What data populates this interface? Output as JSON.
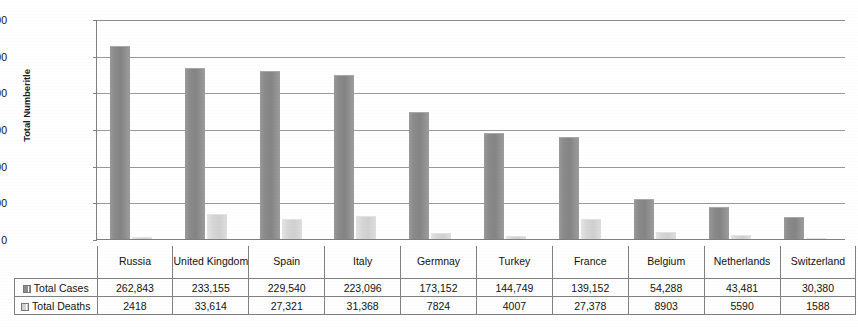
{
  "chart_data": {
    "type": "bar",
    "title": "",
    "xlabel": "",
    "ylabel": "Total Numberitle",
    "ylim": [
      0,
      300000
    ],
    "ytick_step": 50000,
    "grid": true,
    "legend_position": "table-row-headers",
    "categories": [
      "Russia",
      "United Kingdom",
      "Spain",
      "Italy",
      "Germnay",
      "Turkey",
      "France",
      "Belgium",
      "Netherlands",
      "Switzerland"
    ],
    "series": [
      {
        "name": "Total Cases",
        "color": "#8b8b8b",
        "values": [
          262843,
          233155,
          229540,
          223096,
          173152,
          144749,
          139152,
          54288,
          43481,
          30380
        ],
        "labels": [
          "262,843",
          "233,155",
          "229,540",
          "223,096",
          "173,152",
          "144,749",
          "139,152",
          "54,288",
          "43,481",
          "30,380"
        ]
      },
      {
        "name": "Total Deaths",
        "color": "#d6d6d6",
        "values": [
          2418,
          33614,
          27321,
          31368,
          7824,
          4007,
          27378,
          8903,
          5590,
          1588
        ],
        "labels": [
          "2418",
          "33,614",
          "27,321",
          "31,368",
          "7824",
          "4007",
          "27,378",
          "8903",
          "5590",
          "1588"
        ]
      }
    ],
    "ytick_labels": [
      "300,000",
      "250,000",
      "200,000",
      "150,000",
      "100,000",
      "50,000",
      "0"
    ],
    "ytick_values": [
      300000,
      250000,
      200000,
      150000,
      100000,
      50000,
      0
    ]
  },
  "axis": {
    "y_title": "Total Numberitle"
  },
  "table": {
    "category_header": [
      "Russia",
      "United Kingdom",
      "Spain",
      "Italy",
      "Germnay",
      "Turkey",
      "France",
      "Belgium",
      "Netherlands",
      "Switzerland"
    ],
    "rows": [
      {
        "label": "Total Cases",
        "swatch": "cases-swatch",
        "values": [
          "262,843",
          "233,155",
          "229,540",
          "223,096",
          "173,152",
          "144,749",
          "139,152",
          "54,288",
          "43,481",
          "30,380"
        ]
      },
      {
        "label": "Total Deaths",
        "swatch": "deaths-swatch",
        "values": [
          "2418",
          "33,614",
          "27,321",
          "31,368",
          "7824",
          "4007",
          "27,378",
          "8903",
          "5590",
          "1588"
        ]
      }
    ]
  },
  "colors": {
    "cases_bar": "#8b8b8b",
    "deaths_bar": "#d6d6d6",
    "gridline": "#9a9a9a",
    "axis": "#7f7f7f",
    "table_border": "#808080",
    "background": "#ffffff"
  }
}
